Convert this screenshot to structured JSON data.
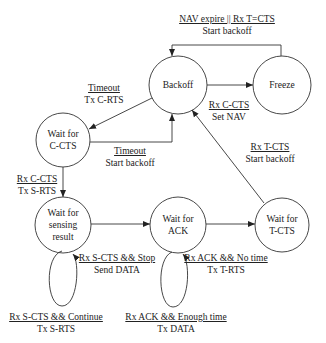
{
  "diagram": {
    "type": "state-machine",
    "colors": {
      "stroke": "#333333",
      "background": "#ffffff",
      "text": "#222222"
    },
    "nodes": [
      {
        "id": "backoff",
        "label": "Backoff",
        "lines": [
          "Backoff"
        ],
        "cx": 178,
        "cy": 85,
        "r": 29
      },
      {
        "id": "freeze",
        "label": "Freeze",
        "lines": [
          "Freeze"
        ],
        "cx": 282,
        "cy": 85,
        "r": 29
      },
      {
        "id": "wait_c_cts",
        "label": "Wait for C-CTS",
        "lines": [
          "Wait for",
          "C-CTS"
        ],
        "cx": 63,
        "cy": 140,
        "r": 27
      },
      {
        "id": "wait_sensing",
        "label": "Wait for sensing result",
        "lines": [
          "Wait for",
          "sensing",
          "result"
        ],
        "cx": 63,
        "cy": 225,
        "r": 28
      },
      {
        "id": "wait_ack",
        "label": "Wait for ACK",
        "lines": [
          "Wait for",
          "ACK"
        ],
        "cx": 178,
        "cy": 225,
        "r": 28
      },
      {
        "id": "wait_t_cts",
        "label": "Wait for T-CTS",
        "lines": [
          "Wait for",
          "T-CTS"
        ],
        "cx": 282,
        "cy": 225,
        "r": 27
      }
    ],
    "edges": [
      {
        "id": "freeze_to_backoff",
        "from": "freeze",
        "to": "backoff",
        "condition": "NAV expire || Rx T=CTS",
        "action": "Start backoff"
      },
      {
        "id": "backoff_to_freeze",
        "from": "backoff",
        "to": "freeze",
        "condition": "Rx C-CTS",
        "action": "Set NAV"
      },
      {
        "id": "backoff_to_wait_c_cts",
        "from": "backoff",
        "to": "wait_c_cts",
        "condition": "Timeout",
        "action": "Tx C-RTS"
      },
      {
        "id": "wait_c_cts_to_backoff",
        "from": "wait_c_cts",
        "to": "backoff",
        "condition": "Timeout",
        "action": "Start backoff"
      },
      {
        "id": "wait_c_cts_to_sensing",
        "from": "wait_c_cts",
        "to": "wait_sensing",
        "condition": "Rx C-CTS",
        "action": "Tx S-RTS"
      },
      {
        "id": "sensing_to_ack",
        "from": "wait_sensing",
        "to": "wait_ack",
        "condition": "Rx S-CTS && Stop",
        "action": "Send DATA"
      },
      {
        "id": "sensing_self",
        "from": "wait_sensing",
        "to": "wait_sensing",
        "condition": "Rx S-CTS && Continue",
        "action": "Tx S-RTS"
      },
      {
        "id": "ack_to_t_cts",
        "from": "wait_ack",
        "to": "wait_t_cts",
        "condition": "Rx ACK && No time",
        "action": "Tx T-RTS"
      },
      {
        "id": "ack_self",
        "from": "wait_ack",
        "to": "wait_ack",
        "condition": "Rx ACK && Enough time",
        "action": "Tx DATA"
      },
      {
        "id": "t_cts_to_backoff",
        "from": "wait_t_cts",
        "to": "backoff",
        "condition": "Rx T-CTS",
        "action": "Start backoff"
      }
    ]
  }
}
